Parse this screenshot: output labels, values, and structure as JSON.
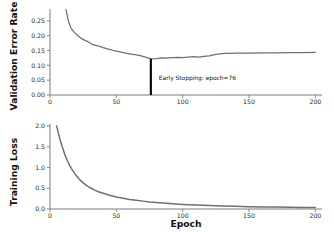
{
  "figure": {
    "background": "#ffffff",
    "curve_color": "#707070",
    "axis_color": "#6e6e6e",
    "annotation_color": "#000000",
    "shared_xlabel": "Epoch"
  },
  "chart_data": [
    {
      "type": "line",
      "panel": "top",
      "title": "",
      "xlabel": "",
      "ylabel": "Validation Error Rate",
      "xlim": [
        0,
        205
      ],
      "ylim": [
        0.0,
        0.29
      ],
      "grid": false,
      "legend": null,
      "xticks": [
        0,
        50,
        100,
        150,
        200
      ],
      "xticklabels": [
        "0",
        "50",
        "100",
        "150",
        "200"
      ],
      "yticks": [
        0.0,
        0.05,
        0.1,
        0.15,
        0.2,
        0.25
      ],
      "yticklabels": [
        "0.00",
        "0.05",
        "0.10",
        "0.15",
        "0.20",
        "0.25"
      ],
      "series": [
        {
          "name": "validation error rate",
          "color": "#707070",
          "x": [
            12,
            14,
            16,
            18,
            20,
            22,
            24,
            26,
            28,
            30,
            32,
            34,
            36,
            38,
            40,
            44,
            48,
            52,
            56,
            60,
            64,
            68,
            72,
            76,
            80,
            84,
            88,
            92,
            96,
            100,
            104,
            108,
            112,
            116,
            120,
            124,
            128,
            132,
            136,
            140,
            150,
            160,
            170,
            180,
            190,
            200
          ],
          "y": [
            0.288,
            0.247,
            0.224,
            0.213,
            0.204,
            0.196,
            0.19,
            0.185,
            0.181,
            0.176,
            0.17,
            0.168,
            0.166,
            0.163,
            0.16,
            0.155,
            0.15,
            0.146,
            0.142,
            0.139,
            0.136,
            0.133,
            0.128,
            0.122,
            0.123,
            0.125,
            0.124,
            0.126,
            0.127,
            0.126,
            0.128,
            0.129,
            0.128,
            0.13,
            0.132,
            0.136,
            0.139,
            0.14,
            0.14,
            0.141,
            0.141,
            0.142,
            0.142,
            0.143,
            0.143,
            0.144
          ]
        }
      ],
      "annotations": [
        {
          "kind": "vline",
          "x": 76,
          "y_top": 0.122,
          "y_bottom": 0.0,
          "color": "#000000",
          "label": "Early Stopping: epoch=76",
          "label_x": 82,
          "label_y": 0.052
        }
      ]
    },
    {
      "type": "line",
      "panel": "bottom",
      "title": "",
      "xlabel": "Epoch",
      "ylabel": "Training Loss",
      "xlim": [
        0,
        205
      ],
      "ylim": [
        0.0,
        2.05
      ],
      "grid": false,
      "legend": null,
      "xticks": [
        0,
        50,
        100,
        150,
        200
      ],
      "xticklabels": [
        "0",
        "50",
        "100",
        "150",
        "200"
      ],
      "yticks": [
        0.0,
        0.5,
        1.0,
        1.5,
        2.0
      ],
      "yticklabels": [
        "0.0",
        "0.5",
        "1.0",
        "1.5",
        "2.0"
      ],
      "series": [
        {
          "name": "training loss",
          "color": "#707070",
          "x": [
            5,
            7,
            9,
            11,
            13,
            15,
            17,
            19,
            21,
            23,
            25,
            28,
            31,
            34,
            37,
            40,
            45,
            50,
            55,
            60,
            65,
            70,
            75,
            80,
            90,
            100,
            110,
            120,
            130,
            140,
            150,
            160,
            170,
            180,
            190,
            200
          ],
          "y": [
            2.0,
            1.74,
            1.52,
            1.33,
            1.17,
            1.04,
            0.93,
            0.84,
            0.76,
            0.69,
            0.63,
            0.56,
            0.5,
            0.45,
            0.41,
            0.38,
            0.33,
            0.29,
            0.26,
            0.23,
            0.21,
            0.19,
            0.17,
            0.155,
            0.13,
            0.11,
            0.095,
            0.082,
            0.072,
            0.064,
            0.057,
            0.051,
            0.046,
            0.042,
            0.038,
            0.035
          ]
        }
      ],
      "annotations": []
    }
  ]
}
